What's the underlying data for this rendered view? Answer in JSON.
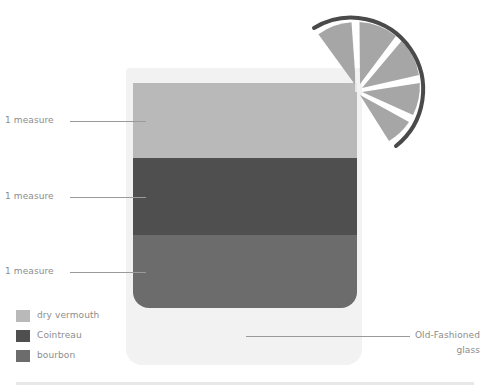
{
  "diagram": {
    "type": "cocktail-recipe",
    "glass": {
      "label_line1": "Old-Fashioned",
      "label_line2": "glass"
    },
    "layers": [
      {
        "ingredient": "dry vermouth",
        "amount": "1 measure",
        "color": "#b9b9b9"
      },
      {
        "ingredient": "Cointreau",
        "amount": "1 measure",
        "color": "#4f4f4f"
      },
      {
        "ingredient": "bourbon",
        "amount": "1 measure",
        "color": "#6c6c6c"
      }
    ],
    "garnish": {
      "name": "lime wedge",
      "segments": 5,
      "flesh_color": "#a6a6a6",
      "rind_color": "#4a4a4a"
    }
  },
  "legend": [
    {
      "label": "dry vermouth",
      "color": "#b9b9b9"
    },
    {
      "label": "Cointreau",
      "color": "#4f4f4f"
    },
    {
      "label": "bourbon",
      "color": "#6c6c6c"
    }
  ],
  "colors": {
    "glass": "#f2f2f2",
    "leader_line": "#9a9a9a",
    "text": "#8c8c8c"
  }
}
